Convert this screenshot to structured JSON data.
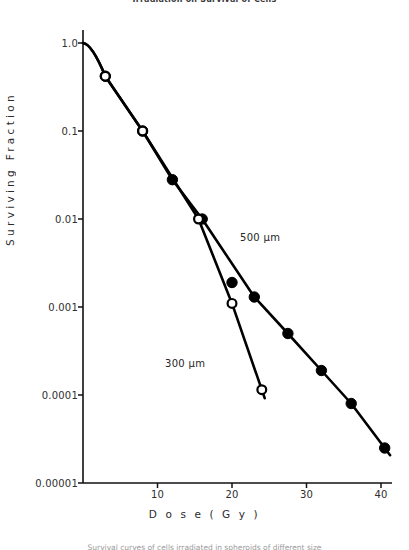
{
  "figure": {
    "running_head": "Irradiation on Survival of Cells",
    "bottom_caption": "Survival curves of cells irradiated in spheroids of different size",
    "y_axis_title": "Surviving Fraction",
    "x_axis_title": "Dose  (Gy)",
    "x_axis_title_spaced": "D o s e    ( G y )"
  },
  "annotations": [
    {
      "name": "series-label-500",
      "text": "500 µm",
      "x": 240,
      "y": 232
    },
    {
      "name": "series-label-300",
      "text": "300 µm",
      "x": 165,
      "y": 358
    }
  ],
  "chart_data": {
    "type": "scatter",
    "title": "Irradiation on Survival of Cells",
    "xlabel": "Dose (Gy)",
    "ylabel": "Surviving Fraction",
    "xlim": [
      0,
      44
    ],
    "ylim": [
      1e-05,
      1.0
    ],
    "yscale": "log",
    "grid": false,
    "legend_position": "inline-annotation",
    "xticks": [
      10,
      20,
      30,
      40
    ],
    "xtick_labels": [
      "10",
      "20",
      "30",
      "40"
    ],
    "yticks": [
      1.0,
      0.1,
      0.01,
      0.001,
      0.0001,
      1e-05
    ],
    "ytick_labels": [
      "1.0",
      "0.1",
      "0.01",
      "0.001",
      "0.0001",
      "0.00001"
    ],
    "series": [
      {
        "name": "500 µm",
        "marker": "filled-circle",
        "color": "#000000",
        "x": [
          3.0,
          8.0,
          12.0,
          16.0,
          20.0,
          23.0,
          27.5,
          32.0,
          36.0,
          40.5
        ],
        "y": [
          0.42,
          0.1,
          0.028,
          0.01,
          0.0019,
          0.0013,
          0.0005,
          0.00019,
          8e-05,
          2.5e-05
        ]
      },
      {
        "name": "300 µm",
        "marker": "open-circle",
        "color": "#000000",
        "x": [
          3.0,
          8.0,
          15.5,
          20.0,
          24.0
        ],
        "y": [
          0.42,
          0.1,
          0.01,
          0.0011,
          0.000115
        ]
      }
    ]
  },
  "axes_geometry": {
    "plot_left": 83,
    "plot_right": 392,
    "plot_top": 43,
    "plot_bottom": 483,
    "x_per_unit": 7.45,
    "decade_px": 88
  }
}
